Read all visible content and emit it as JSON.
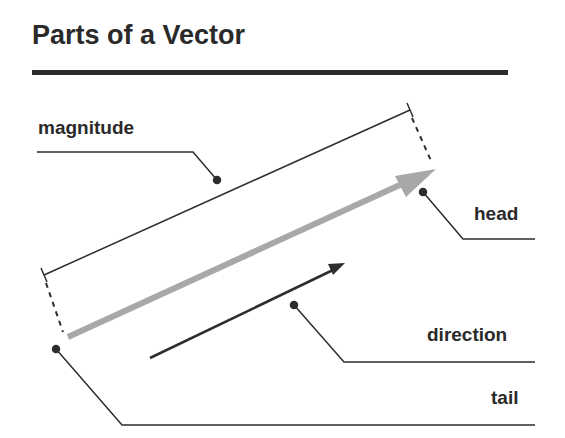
{
  "title": "Parts of a Vector",
  "labels": {
    "magnitude": "magnitude",
    "head": "head",
    "direction": "direction",
    "tail": "tail"
  },
  "colors": {
    "vector": "#a8a8a8",
    "lines": "#2d2d2d",
    "text": "#2a2a2a"
  }
}
